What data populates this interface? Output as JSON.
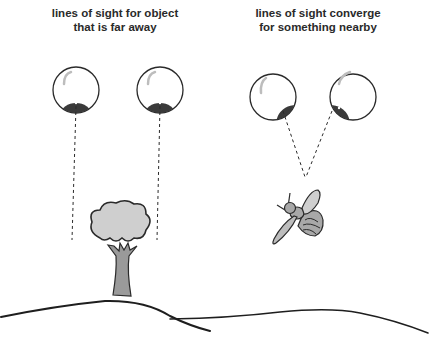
{
  "captions": {
    "far": {
      "line1": "lines of sight for object",
      "line2": "that is far away"
    },
    "near": {
      "line1": "lines of sight converge",
      "line2": "for something nearby"
    }
  },
  "figure": {
    "left_panel": {
      "object": "tree",
      "eyes": 2,
      "lines_of_sight": "parallel"
    },
    "right_panel": {
      "object": "bee",
      "eyes": 2,
      "lines_of_sight": "converging"
    }
  },
  "colors": {
    "ink": "#2a2a2a",
    "pupil": "#3a3a3a",
    "foliage": "#cfcfcf",
    "trunk": "#9a9a9a",
    "bee_body": "#a8a8a8",
    "highlight": "#bdbdbd"
  }
}
